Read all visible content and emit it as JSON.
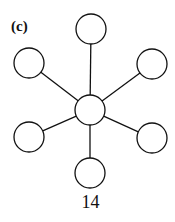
{
  "panel_label": "(c)",
  "caption": "14",
  "graph": {
    "type": "star",
    "center": {
      "x": 90,
      "y": 110,
      "r": 15
    },
    "leaves": [
      {
        "x": 91,
        "y": 29,
        "r": 15
      },
      {
        "x": 29,
        "y": 63,
        "r": 15
      },
      {
        "x": 152,
        "y": 64,
        "r": 15
      },
      {
        "x": 29,
        "y": 137,
        "r": 15
      },
      {
        "x": 152,
        "y": 138,
        "r": 15
      },
      {
        "x": 90,
        "y": 173,
        "r": 15
      }
    ]
  }
}
